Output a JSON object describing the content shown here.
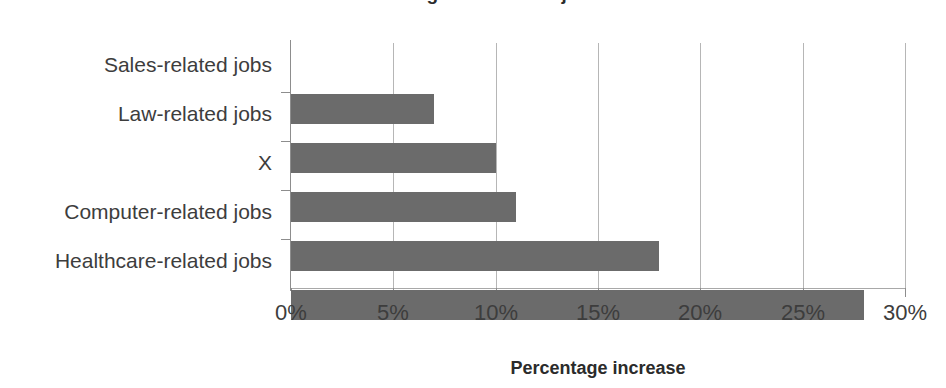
{
  "chart_data": {
    "type": "bar",
    "orientation": "horizontal",
    "title": "Percentage increase in jobs",
    "categories": [
      "Sales-related jobs",
      "Law-related jobs",
      "X",
      "Computer-related jobs",
      "Healthcare-related jobs"
    ],
    "values": [
      7,
      10,
      11,
      18,
      28
    ],
    "xlabel": "Percentage increase",
    "ylabel": "",
    "xlim": [
      0,
      30
    ],
    "xticks": [
      0,
      5,
      10,
      15,
      20,
      25,
      30
    ],
    "xtick_labels": [
      "0%",
      "5%",
      "10%",
      "15%",
      "20%",
      "25%",
      "30%"
    ],
    "grid": "vertical",
    "legend": "none",
    "bar_color": "#6b6b6b",
    "gridline_color": "#b6b6b6",
    "axis_color": "#8d8d8d",
    "value_unit": "%"
  }
}
